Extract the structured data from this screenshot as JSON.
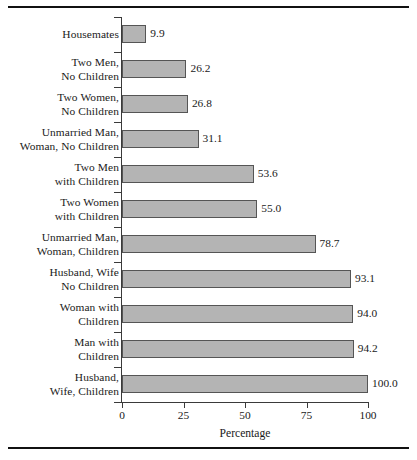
{
  "chart_data": {
    "type": "bar",
    "orientation": "horizontal",
    "title": "",
    "subtitle": "",
    "xlabel": "Percentage",
    "ylabel": "",
    "xlim": [
      0,
      100
    ],
    "xticks": [
      0,
      25,
      50,
      75,
      100
    ],
    "xticklabels": [
      "0",
      "25",
      "50",
      "75",
      "100"
    ],
    "grid": false,
    "legend": false,
    "bar_color": "#b4b4b4",
    "bar_edge_color": "#555555",
    "axis_color": "#3a3a3a",
    "categories": [
      "Housemates",
      "Two Men, No Children",
      "Two Women, No Children",
      "Unmarried Man, Woman, No Children",
      "Two Men with Children",
      "Two Women with Children",
      "Unmarried Man, Woman, Children",
      "Husband, Wife No Children",
      "Woman with Children",
      "Man with Children",
      "Husband, Wife, Children"
    ],
    "values": [
      9.9,
      26.2,
      26.8,
      31.1,
      53.6,
      55.0,
      78.7,
      93.1,
      94.0,
      94.2,
      100.0
    ],
    "value_labels": [
      "9.9",
      "26.2",
      "26.8",
      "31.1",
      "53.6",
      "55.0",
      "78.7",
      "93.1",
      "94.0",
      "94.2",
      "100.0"
    ],
    "category_label_lines": [
      [
        "Housemates"
      ],
      [
        "Two Men,",
        "No Children"
      ],
      [
        "Two Women,",
        "No Children"
      ],
      [
        "Unmarried Man,",
        "Woman, No Children"
      ],
      [
        "Two Men",
        "with Children"
      ],
      [
        "Two Women",
        "with Children"
      ],
      [
        "Unmarried Man,",
        "Woman, Children"
      ],
      [
        "Husband, Wife",
        "No Children"
      ],
      [
        "Woman with",
        "Children"
      ],
      [
        "Man with",
        "Children"
      ],
      [
        "Husband,",
        "Wife, Children"
      ]
    ]
  }
}
